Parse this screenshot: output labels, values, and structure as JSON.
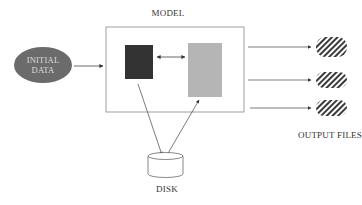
{
  "diagram": {
    "model_label": "MODEL",
    "input_label_line1": "INITIAL",
    "input_label_line2": "DATA",
    "disk_label": "DISK",
    "output_label": "OUTPUT FILES",
    "output_file_count": 3
  },
  "colors": {
    "input_ellipse": "#6b6b6b",
    "dark_block": "#333333",
    "light_block": "#b5b5b5",
    "frame": "#888888",
    "arrow": "#444444",
    "hatch": "#3a3a3a"
  }
}
